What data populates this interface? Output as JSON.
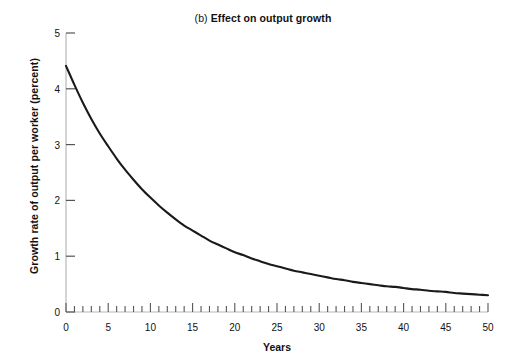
{
  "chart_data": {
    "type": "line",
    "title": "(b) Effect on output growth",
    "title_prefix": "(b) ",
    "title_main": "Effect on output growth",
    "xlabel": "Years",
    "ylabel": "Growth rate of output per worker (percent)",
    "xlim": [
      0,
      50
    ],
    "ylim": [
      0,
      5
    ],
    "x_major_step": 5,
    "x_minor_step": 1,
    "y_major_step": 1,
    "grid": false,
    "legend": null,
    "line_color": "#1a1a1a",
    "axis_color": "#b8b8b8",
    "tick_color": "#555555",
    "xticks": [
      0,
      5,
      10,
      15,
      20,
      25,
      30,
      35,
      40,
      45,
      50
    ],
    "xtick_labels": [
      "0",
      "5",
      "10",
      "15",
      "20",
      "25",
      "30",
      "35",
      "40",
      "45",
      "50"
    ],
    "yticks": [
      0,
      1,
      2,
      3,
      4,
      5
    ],
    "ytick_labels": [
      "0",
      "1",
      "2",
      "3",
      "4",
      "5"
    ],
    "series": [
      {
        "name": "Growth rate of output per worker",
        "x": [
          0,
          1,
          2,
          3,
          4,
          5,
          6,
          7,
          8,
          9,
          10,
          11,
          12,
          13,
          14,
          15,
          16,
          17,
          18,
          19,
          20,
          21,
          22,
          23,
          24,
          25,
          26,
          27,
          28,
          29,
          30,
          31,
          32,
          33,
          34,
          35,
          36,
          37,
          38,
          39,
          40,
          41,
          42,
          43,
          44,
          45,
          46,
          47,
          48,
          49,
          50
        ],
        "values": [
          4.41,
          4.07,
          3.75,
          3.46,
          3.2,
          2.97,
          2.75,
          2.55,
          2.37,
          2.2,
          2.05,
          1.91,
          1.78,
          1.66,
          1.55,
          1.46,
          1.37,
          1.28,
          1.21,
          1.14,
          1.07,
          1.02,
          0.96,
          0.91,
          0.86,
          0.82,
          0.78,
          0.74,
          0.71,
          0.68,
          0.65,
          0.62,
          0.59,
          0.57,
          0.54,
          0.52,
          0.5,
          0.48,
          0.46,
          0.45,
          0.43,
          0.41,
          0.4,
          0.38,
          0.37,
          0.36,
          0.34,
          0.33,
          0.32,
          0.31,
          0.3
        ]
      }
    ]
  }
}
